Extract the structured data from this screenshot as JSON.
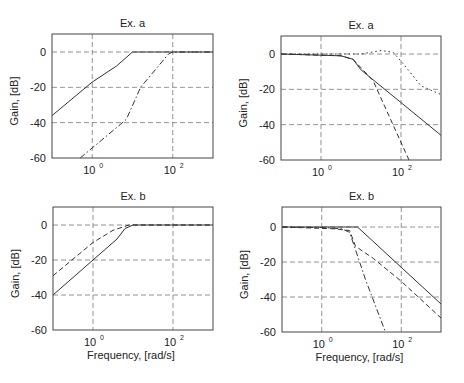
{
  "figure": {
    "xlabel": "Frequency, [rad/s]",
    "ylabel": "Gain, [dB]"
  },
  "chart_data": [
    {
      "type": "line",
      "title": "Ex. a",
      "position": "top-left",
      "xlabel": "",
      "ylabel": "Gain, [dB]",
      "xscale": "log",
      "xlim": [
        0.1,
        1000
      ],
      "ylim": [
        -60,
        10
      ],
      "xticks": [
        "10^0",
        "10^2"
      ],
      "yticks": [
        0,
        -20,
        -40,
        -60
      ],
      "grid": true,
      "series": [
        {
          "name": "solid",
          "style": "solid",
          "x_log10": [
            -1,
            0,
            0.6,
            1,
            3
          ],
          "y": [
            -36,
            -17,
            -8,
            0,
            0
          ]
        },
        {
          "name": "dash-dot",
          "style": "dashdot",
          "x_log10": [
            -0.3,
            0.7,
            0.85,
            1.2,
            1.9,
            2,
            3
          ],
          "y": [
            -60,
            -41,
            -38,
            -20,
            -1,
            0,
            0
          ]
        }
      ]
    },
    {
      "type": "line",
      "title": "Ex. a",
      "position": "top-right",
      "xlabel": "",
      "ylabel": "Gain, [dB]",
      "xscale": "log",
      "xlim": [
        0.1,
        1000
      ],
      "ylim": [
        -60,
        10
      ],
      "xticks": [
        "10^0",
        "10^2"
      ],
      "yticks": [
        0,
        -20,
        -40,
        -60
      ],
      "grid": true,
      "series": [
        {
          "name": "solid",
          "style": "solid",
          "x_log10": [
            -1,
            0.5,
            0.8,
            1,
            3
          ],
          "y": [
            0,
            -1,
            -3,
            -9,
            -46
          ]
        },
        {
          "name": "dashed",
          "style": "dashed",
          "x_log10": [
            -1,
            0.5,
            0.8,
            1.3,
            1.8,
            2.2
          ],
          "y": [
            0,
            -1,
            -3,
            -15,
            -40,
            -60
          ]
        },
        {
          "name": "dotted",
          "style": "dotted",
          "x_log10": [
            -1,
            1,
            1.5,
            1.8,
            2,
            2.5,
            3
          ],
          "y": [
            0,
            0,
            2,
            1,
            -4,
            -18,
            -23
          ]
        }
      ]
    },
    {
      "type": "line",
      "title": "Ex. b",
      "position": "bottom-left",
      "xlabel": "Frequency, [rad/s]",
      "ylabel": "Gain, [dB]",
      "xscale": "log",
      "xlim": [
        0.1,
        1000
      ],
      "ylim": [
        -60,
        10
      ],
      "xticks": [
        "10^0",
        "10^2"
      ],
      "yticks": [
        0,
        -20,
        -40,
        -60
      ],
      "grid": true,
      "series": [
        {
          "name": "solid",
          "style": "solid",
          "x_log10": [
            -1,
            0,
            0.6,
            0.8,
            1,
            3
          ],
          "y": [
            -40,
            -20,
            -8,
            -2,
            0,
            0
          ]
        },
        {
          "name": "dashed",
          "style": "dashed",
          "x_log10": [
            -1,
            0,
            0.5,
            0.9,
            3
          ],
          "y": [
            -29,
            -10,
            -3,
            0,
            0
          ]
        }
      ]
    },
    {
      "type": "line",
      "title": "Ex. b",
      "position": "bottom-right",
      "xlabel": "Frequency, [rad/s]",
      "ylabel": "Gain, [dB]",
      "xscale": "log",
      "xlim": [
        0.1,
        1000
      ],
      "ylim": [
        -60,
        10
      ],
      "xticks": [
        "10^0",
        "10^2"
      ],
      "yticks": [
        0,
        -20,
        -40,
        -60
      ],
      "grid": true,
      "series": [
        {
          "name": "solid",
          "style": "solid",
          "x_log10": [
            -1,
            0.9,
            3
          ],
          "y": [
            0,
            0,
            -44
          ]
        },
        {
          "name": "dash-dot",
          "style": "dashdot",
          "x_log10": [
            -1,
            0,
            0.5,
            0.7,
            1.1,
            1.6
          ],
          "y": [
            0,
            -0.3,
            -1,
            -3,
            -30,
            -60
          ]
        },
        {
          "name": "dashed",
          "style": "dashed",
          "x_log10": [
            -1,
            0.3,
            0.7,
            0.85,
            1.3,
            2,
            3
          ],
          "y": [
            0,
            -1,
            -2,
            -11,
            -18,
            -31,
            -52
          ]
        }
      ]
    }
  ]
}
